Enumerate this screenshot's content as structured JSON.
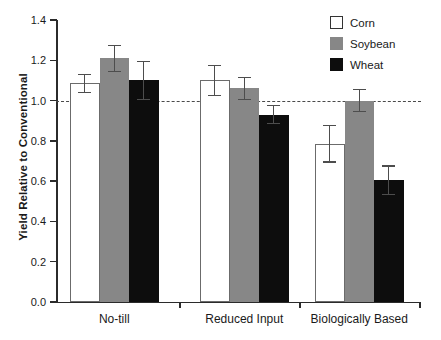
{
  "chart_data": {
    "type": "bar",
    "title": "",
    "xlabel": "",
    "ylabel": "Yield Relative to Conventional",
    "categories": [
      "No-till",
      "Reduced Input",
      "Biologically Based"
    ],
    "series": [
      {
        "name": "Corn",
        "color": "#ffffff",
        "values": [
          1.085,
          1.1,
          0.785
        ],
        "errors": [
          0.045,
          0.075,
          0.09
        ]
      },
      {
        "name": "Soybean",
        "color": "#878787",
        "values": [
          1.21,
          1.06,
          1.0
        ],
        "errors": [
          0.065,
          0.055,
          0.055
        ]
      },
      {
        "name": "Wheat",
        "color": "#0d0d0d",
        "values": [
          1.1,
          0.93,
          0.605
        ],
        "errors": [
          0.095,
          0.045,
          0.07
        ]
      }
    ],
    "ylim": [
      0.0,
      1.4
    ],
    "ytick_labels": [
      "0.0",
      "0.2",
      "0.4",
      "0.6",
      "0.8",
      "1.0",
      "1.2",
      "1.4"
    ],
    "ytick_values": [
      0.0,
      0.2,
      0.4,
      0.6,
      0.8,
      1.0,
      1.2,
      1.4
    ],
    "grid": false,
    "reference_line": {
      "value": 1.0,
      "style": "dashed",
      "color": "#4a4a4a"
    },
    "legend": {
      "position": "top-right",
      "entries": [
        "Corn",
        "Soybean",
        "Wheat"
      ]
    },
    "error_bar_style": "capped"
  }
}
